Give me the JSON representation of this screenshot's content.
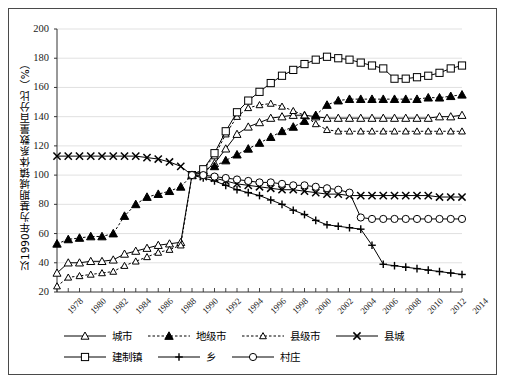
{
  "figure": {
    "background": "#ffffff",
    "frame_color": "#4a4a4a",
    "grid_color": "#d9d9d9",
    "axis_color": "#333333",
    "series_color": "#000000"
  },
  "chart_data": {
    "type": "line",
    "title": "",
    "xlabel": "",
    "ylabel": "以1990年为基期城镇体系数量百分比（%）",
    "xlim": [
      1978,
      2014
    ],
    "ylim": [
      20,
      200
    ],
    "ytick_step": 20,
    "grid": true,
    "legend_position": "bottom",
    "yticks": [
      20,
      40,
      60,
      80,
      100,
      120,
      140,
      160,
      180,
      200
    ],
    "xticks": [
      1978,
      1980,
      1982,
      1984,
      1986,
      1988,
      1990,
      1992,
      1994,
      1996,
      1998,
      2000,
      2002,
      2004,
      2006,
      2008,
      2010,
      2012,
      2014
    ],
    "x": [
      1978,
      1979,
      1980,
      1981,
      1982,
      1983,
      1984,
      1985,
      1986,
      1987,
      1988,
      1989,
      1990,
      1991,
      1992,
      1993,
      1994,
      1995,
      1996,
      1997,
      1998,
      1999,
      2000,
      2001,
      2002,
      2003,
      2004,
      2005,
      2006,
      2007,
      2008,
      2009,
      2010,
      2011,
      2012,
      2013,
      2014
    ],
    "series": [
      {
        "name": "城市",
        "marker": "triangle-open",
        "linestyle": "solid",
        "values": [
          33,
          40,
          40,
          41,
          41,
          42,
          46,
          48,
          50,
          52,
          53,
          54,
          100,
          102,
          108,
          118,
          128,
          133,
          136,
          139,
          140,
          141,
          141,
          140,
          139,
          139,
          139,
          139,
          139,
          139,
          139,
          139,
          139,
          139,
          140,
          140,
          141
        ]
      },
      {
        "name": "地级市",
        "marker": "triangle-filled",
        "linestyle": "dashed",
        "values": [
          53,
          56,
          57,
          58,
          58,
          60,
          72,
          80,
          85,
          87,
          89,
          92,
          100,
          103,
          106,
          110,
          114,
          118,
          122,
          126,
          130,
          133,
          137,
          141,
          148,
          151,
          152,
          152,
          152,
          152,
          152,
          152,
          152,
          153,
          153,
          154,
          155
        ]
      },
      {
        "name": "县级市",
        "marker": "triangle-open-sm",
        "linestyle": "dashed",
        "values": [
          24,
          30,
          31,
          32,
          33,
          34,
          38,
          41,
          44,
          47,
          49,
          52,
          100,
          104,
          113,
          128,
          140,
          146,
          148,
          149,
          147,
          144,
          141,
          135,
          131,
          130,
          130,
          130,
          130,
          130,
          130,
          130,
          130,
          130,
          130,
          130,
          130
        ]
      },
      {
        "name": "县城",
        "marker": "x",
        "linestyle": "solid",
        "values": [
          113,
          113,
          113,
          113,
          113,
          113,
          113,
          113,
          112,
          111,
          109,
          106,
          100,
          99,
          98,
          96,
          94,
          93,
          92,
          91,
          90,
          90,
          89,
          88,
          87,
          87,
          86,
          86,
          86,
          86,
          86,
          86,
          86,
          86,
          85,
          85,
          85
        ]
      },
      {
        "name": "建制镇",
        "marker": "square-open",
        "linestyle": "solid",
        "values": [
          null,
          null,
          null,
          null,
          null,
          null,
          null,
          null,
          null,
          null,
          null,
          null,
          100,
          104,
          115,
          130,
          143,
          151,
          157,
          163,
          168,
          172,
          176,
          179,
          181,
          180,
          179,
          177,
          175,
          173,
          166,
          166,
          167,
          168,
          170,
          173,
          175
        ]
      },
      {
        "name": "乡",
        "marker": "plus",
        "linestyle": "solid",
        "values": [
          null,
          null,
          null,
          null,
          null,
          null,
          null,
          null,
          null,
          null,
          null,
          null,
          100,
          98,
          96,
          93,
          90,
          88,
          86,
          83,
          80,
          76,
          73,
          69,
          66,
          65,
          64,
          63,
          52,
          39,
          38,
          37,
          36,
          35,
          34,
          33,
          32
        ]
      },
      {
        "name": "村庄",
        "marker": "circle-open",
        "linestyle": "solid",
        "values": [
          null,
          null,
          null,
          null,
          null,
          null,
          null,
          null,
          null,
          null,
          null,
          null,
          100,
          100,
          99,
          98,
          97,
          96,
          95,
          95,
          94,
          93,
          93,
          92,
          91,
          90,
          88,
          71,
          70,
          70,
          70,
          70,
          70,
          70,
          70,
          70,
          70
        ]
      }
    ]
  },
  "legend": {
    "rows": [
      [
        {
          "label": "城市",
          "marker": "triangle-open",
          "linestyle": "solid"
        },
        {
          "label": "地级市",
          "marker": "triangle-filled",
          "linestyle": "dashed"
        },
        {
          "label": "县级市",
          "marker": "triangle-open-sm",
          "linestyle": "dashed"
        },
        {
          "label": "县城",
          "marker": "x",
          "linestyle": "solid"
        }
      ],
      [
        {
          "label": "建制镇",
          "marker": "square-open",
          "linestyle": "solid"
        },
        {
          "label": "乡",
          "marker": "plus",
          "linestyle": "solid"
        },
        {
          "label": "村庄",
          "marker": "circle-open",
          "linestyle": "solid"
        }
      ]
    ]
  }
}
